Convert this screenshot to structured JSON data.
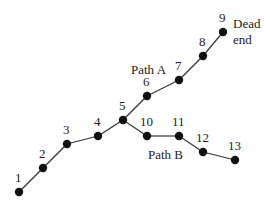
{
  "diagram": {
    "nodes": [
      {
        "id": "1",
        "x": 19,
        "y": 192,
        "lx": 15,
        "ly": 182
      },
      {
        "id": "2",
        "x": 43,
        "y": 168,
        "lx": 39,
        "ly": 158
      },
      {
        "id": "3",
        "x": 67,
        "y": 144,
        "lx": 63,
        "ly": 134
      },
      {
        "id": "4",
        "x": 98,
        "y": 136,
        "lx": 94,
        "ly": 126
      },
      {
        "id": "5",
        "x": 123,
        "y": 120,
        "lx": 119,
        "ly": 110
      },
      {
        "id": "6",
        "x": 147,
        "y": 96,
        "lx": 143,
        "ly": 86
      },
      {
        "id": "7",
        "x": 179,
        "y": 80,
        "lx": 175,
        "ly": 70
      },
      {
        "id": "8",
        "x": 203,
        "y": 56,
        "lx": 199,
        "ly": 46
      },
      {
        "id": "9",
        "x": 223,
        "y": 32,
        "lx": 219,
        "ly": 22
      },
      {
        "id": "10",
        "x": 147,
        "y": 136,
        "lx": 140,
        "ly": 126
      },
      {
        "id": "11",
        "x": 179,
        "y": 136,
        "lx": 172,
        "ly": 126
      },
      {
        "id": "12",
        "x": 203,
        "y": 152,
        "lx": 196,
        "ly": 142
      },
      {
        "id": "13",
        "x": 235,
        "y": 160,
        "lx": 228,
        "ly": 150
      }
    ],
    "edges": [
      [
        "1",
        "2"
      ],
      [
        "2",
        "3"
      ],
      [
        "3",
        "4"
      ],
      [
        "4",
        "5"
      ],
      [
        "5",
        "6"
      ],
      [
        "6",
        "7"
      ],
      [
        "7",
        "8"
      ],
      [
        "8",
        "9"
      ],
      [
        "5",
        "10"
      ],
      [
        "10",
        "11"
      ],
      [
        "11",
        "12"
      ],
      [
        "12",
        "13"
      ]
    ],
    "annotations": {
      "path_a": {
        "text": "Path A",
        "x": 131,
        "y": 74
      },
      "path_b": {
        "text": "Path B",
        "x": 148,
        "y": 159
      },
      "dead_end_1": {
        "text": "Dead",
        "x": 233,
        "y": 28
      },
      "dead_end_2": {
        "text": "end",
        "x": 233,
        "y": 44
      }
    },
    "colors": {
      "node": "#111111",
      "edge": "#333333",
      "text": "#222222"
    }
  }
}
